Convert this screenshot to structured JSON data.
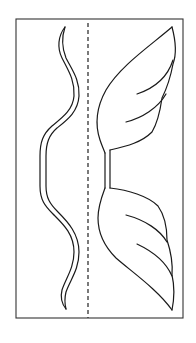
{
  "diagram": {
    "type": "craft-template",
    "colors": {
      "background": "#ffffff",
      "line": "#1a1a1a",
      "frame": "#333333"
    },
    "parts": [
      {
        "id": "frame",
        "label": "outer border"
      },
      {
        "id": "fold-line",
        "label": "dashed fold line"
      },
      {
        "id": "wavy-strip",
        "label": "wavy double-line strip"
      },
      {
        "id": "upper-wing",
        "label": "upper wing with feather lines"
      },
      {
        "id": "wing-stem",
        "label": "connecting stem"
      },
      {
        "id": "lower-wing",
        "label": "lower wing with feather lines"
      }
    ]
  }
}
